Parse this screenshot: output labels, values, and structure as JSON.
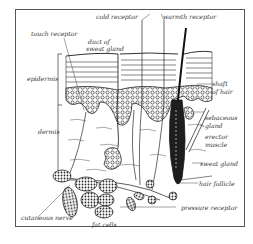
{
  "diagram": {
    "labels": {
      "cold_receptor": "cold receptor",
      "warmth_receptor": "warmth receptor",
      "touch_receptor": "touch receptor",
      "duct_of_sweat_gland_1": "duct of",
      "duct_of_sweat_gland_2": "sweat gland",
      "epidermis": "epidermis",
      "dermis": "dermis",
      "shaft_of_hair_1": "shaft",
      "shaft_of_hair_2": "of hair",
      "sebaceous_gland_1": "sebaceous",
      "sebaceous_gland_2": "gland",
      "erector_muscle_1": "erector",
      "erector_muscle_2": "muscle",
      "sweat_gland": "sweat gland",
      "hair_follicle": "hair follicle",
      "pressure_receptor": "pressure receptor",
      "cutaneous_nerve": "cutaneous nerve",
      "fat_cells": "fat cells"
    },
    "colors": {
      "line": "#2a2a2a",
      "frame": "#555555",
      "background": "#ffffff"
    }
  }
}
